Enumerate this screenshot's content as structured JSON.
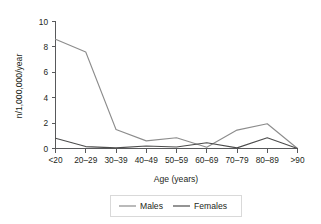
{
  "chart_data": {
    "type": "line",
    "title": "",
    "xlabel": "Age (years)",
    "ylabel": "n/1,000,000/year",
    "categories": [
      "<20",
      "20–29",
      "30–39",
      "40–49",
      "50–59",
      "60–69",
      "70–79",
      "80–89",
      ">90"
    ],
    "yticks": [
      "0",
      "2",
      "4",
      "6",
      "8",
      "10"
    ],
    "ytick_values": [
      0,
      2,
      4,
      6,
      8,
      10
    ],
    "ylim": [
      0,
      10
    ],
    "grid": false,
    "legend_position": "bottom",
    "series": [
      {
        "name": "Males",
        "color": "#8c8c8c",
        "values": [
          8.6,
          7.6,
          1.5,
          0.6,
          0.85,
          0.1,
          1.45,
          1.95,
          0.0
        ]
      },
      {
        "name": "Females",
        "color": "#4d4d4d",
        "values": [
          0.8,
          0.15,
          0.05,
          0.2,
          0.12,
          0.45,
          0.05,
          0.85,
          0.0
        ]
      }
    ]
  },
  "legend": {
    "items": [
      {
        "label": "Males",
        "color": "#8c8c8c"
      },
      {
        "label": "Females",
        "color": "#4d4d4d"
      }
    ]
  },
  "axes": {
    "y_axis_label": "n/1,000,000/year",
    "x_axis_label": "Age (years)"
  }
}
